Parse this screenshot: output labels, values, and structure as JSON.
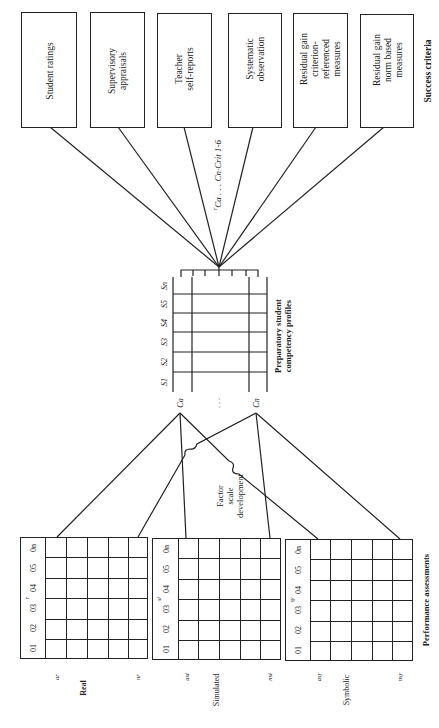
{
  "diagram": {
    "orientation": "rotated-90-ccw",
    "success_criteria": {
      "label": "Success criteria",
      "boxes": [
        {
          "label": "Student ratings"
        },
        {
          "label": "Supervisory\nappraisals"
        },
        {
          "label": "Teacher\nself-reports"
        },
        {
          "label": "Systematic\nobservation"
        },
        {
          "label": "Residual gain\ncriterion-\nreferenced\nmeasures"
        },
        {
          "label": "Residual gain\nnorm based\nmeasures"
        }
      ],
      "correlation_label": "rCa . . . Cn·Crit 1-6",
      "correlation_prefix": "r",
      "correlation_body": "Ca . . . Cn·Crit 1-6"
    },
    "profiles": {
      "label": "Preparatory student\ncompetency profiles",
      "columns": [
        "S1",
        "S2",
        "S3",
        "S4",
        "S5",
        "Sn"
      ],
      "rows": [
        "Ca",
        "Cn"
      ],
      "row_ellipsis": ". . ."
    },
    "factor_label": "Factor\nscale\ndevelopment",
    "performance": {
      "label": "Performance assessments",
      "grids": [
        {
          "name": "Real",
          "code": "r",
          "first": "ar",
          "last": "nr",
          "columns": [
            "01",
            "02",
            "03",
            "04",
            "05",
            "0n"
          ]
        },
        {
          "name": "Simulated",
          "code": "si",
          "first": "asi",
          "last": "nsi",
          "columns": [
            "01",
            "02",
            "03",
            "04",
            "05",
            "0n"
          ]
        },
        {
          "name": "Symbolic",
          "code": "sy",
          "first": "asy",
          "last": "nsy",
          "columns": [
            "01",
            "02",
            "03",
            "04",
            "05",
            "0n"
          ]
        }
      ]
    },
    "colors": {
      "line": "#222222",
      "background": "#ffffff"
    }
  }
}
